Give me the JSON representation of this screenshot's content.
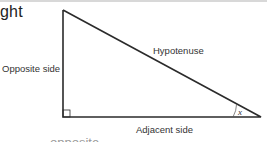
{
  "heading_fragment": "ght",
  "triangle": {
    "labels": {
      "opposite": "Opposite side",
      "hypotenuse": "Hypotenuse",
      "adjacent": "Adjacent side",
      "angle": "x"
    },
    "right_angle_marker": true,
    "stroke_color": "#2b2b2b"
  },
  "cropped_caption": "opposite"
}
